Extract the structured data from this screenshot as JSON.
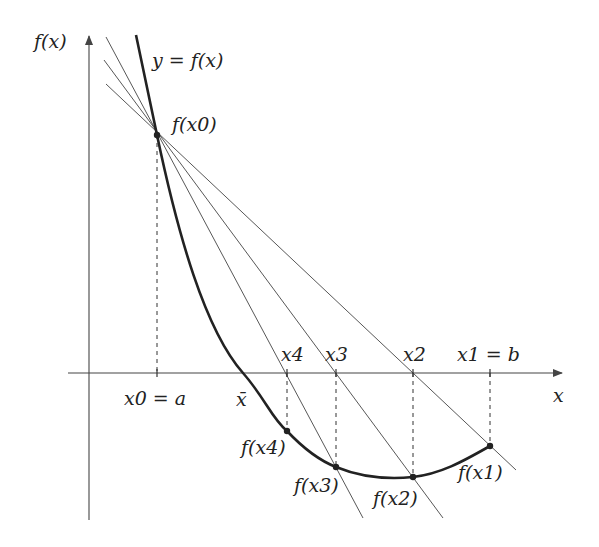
{
  "diagram": {
    "axes": {
      "y_label": "f(x)",
      "x_label": "x"
    },
    "curve_label": "y = f(x)",
    "points": [
      {
        "id": "x0",
        "axis_label": "x0 = a",
        "value_label": "f(x0)"
      },
      {
        "id": "x1",
        "axis_label": "x1 = b",
        "value_label": "f(x1)"
      },
      {
        "id": "x2",
        "axis_label": "x2",
        "value_label": "f(x2)"
      },
      {
        "id": "x3",
        "axis_label": "x3",
        "value_label": "f(x3)"
      },
      {
        "id": "x4",
        "axis_label": "x4",
        "value_label": "f(x4)"
      }
    ],
    "root_label": "x̄",
    "colors": {
      "curve": "#222222",
      "secant": "#444444",
      "axis": "#444444",
      "dashed": "#333333"
    }
  }
}
